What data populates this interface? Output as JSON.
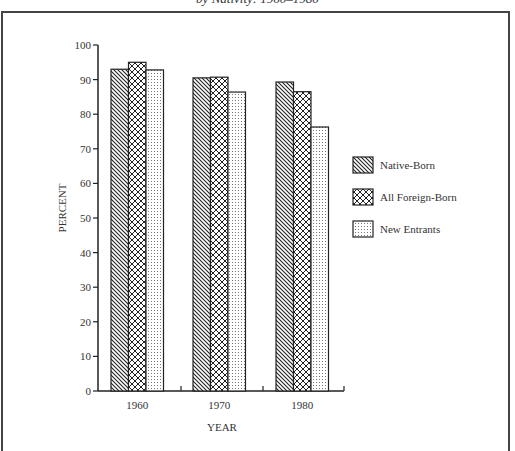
{
  "chart_data": {
    "type": "bar",
    "title": "by Nativity: 1960–1980",
    "xlabel": "YEAR",
    "ylabel": "PERCENT",
    "ylim": [
      0,
      100
    ],
    "yticks": [
      0,
      10,
      20,
      30,
      40,
      50,
      60,
      70,
      80,
      90,
      100
    ],
    "categories": [
      "1960",
      "1970",
      "1980"
    ],
    "series": [
      {
        "name": "Native-Born",
        "pattern": "diagonal-hatch",
        "values": [
          93,
          90.5,
          89.3
        ]
      },
      {
        "name": "All Foreign-Born",
        "pattern": "crosshatch",
        "values": [
          95,
          90.7,
          86.5
        ]
      },
      {
        "name": "New Entrants",
        "pattern": "dots",
        "values": [
          92.8,
          86.4,
          76.3
        ]
      }
    ],
    "grid": false,
    "legend_position": "right"
  },
  "colors": {
    "ink": "#222222",
    "frame": "#444444",
    "background": "#ffffff"
  }
}
